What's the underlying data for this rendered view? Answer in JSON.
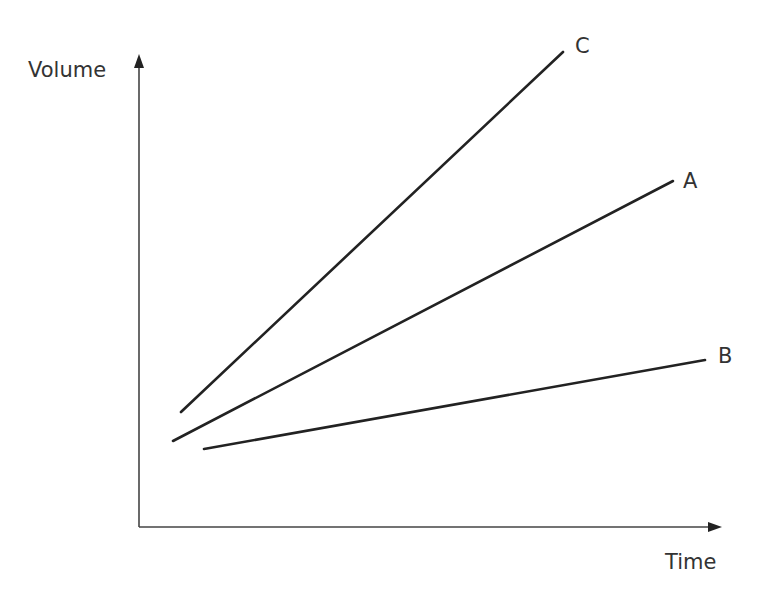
{
  "chart_data": {
    "type": "line",
    "title": "",
    "xlabel": "Time",
    "ylabel": "Volume",
    "xlim": [
      0,
      100
    ],
    "ylim": [
      0,
      100
    ],
    "grid": false,
    "legend": "inline labels at line ends",
    "series": [
      {
        "name": "C",
        "points": [
          [
            7,
            24
          ],
          [
            72,
            97
          ]
        ]
      },
      {
        "name": "A",
        "points": [
          [
            6,
            18
          ],
          [
            91,
            71
          ]
        ]
      },
      {
        "name": "B",
        "points": [
          [
            11,
            16
          ],
          [
            97,
            35
          ]
        ]
      }
    ],
    "pixel_series": [
      {
        "name": "C",
        "x1": 181,
        "y1": 412,
        "x2": 563,
        "y2": 52,
        "label_x": 575,
        "label_y": 53
      },
      {
        "name": "A",
        "x1": 173,
        "y1": 441,
        "x2": 673,
        "y2": 181,
        "label_x": 683,
        "label_y": 188
      },
      {
        "name": "B",
        "x1": 204,
        "y1": 449,
        "x2": 705,
        "y2": 360,
        "label_x": 718,
        "label_y": 363
      }
    ]
  },
  "axes": {
    "y_label": "Volume",
    "x_label": "Time"
  }
}
